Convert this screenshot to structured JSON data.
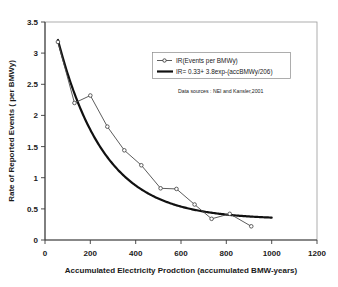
{
  "chart_data": {
    "type": "line",
    "title": "",
    "xlabel": "Accumulated Electricity Prodction (accumulated BMW-years)",
    "ylabel": "Rate of Reported Events ( per BMWy)",
    "xlim": [
      0,
      1200
    ],
    "ylim": [
      0,
      3.5
    ],
    "xticks": [
      0,
      200,
      400,
      600,
      800,
      1000,
      1200
    ],
    "xtick_labels": [
      "0",
      "200",
      "400",
      "600",
      "800",
      "1000",
      "1200"
    ],
    "yticks": [
      0,
      0.5,
      1,
      1.5,
      2,
      2.5,
      3,
      3.5
    ],
    "ytick_labels": [
      "0",
      "0.5",
      "1",
      "1.5",
      "2",
      "2.5",
      "3",
      "3.5"
    ],
    "grid": false,
    "legend_position": "upper-right-inside",
    "annotations": [
      {
        "name": "data-sources",
        "text": "Data sources : NEI and Kansler,2001",
        "x": 410,
        "y": 2.52
      }
    ],
    "series": [
      {
        "name": "IR(Events per BMWy)",
        "style": "line-with-open-circle-markers",
        "color": "#4a4a4a",
        "marker": "open-circle",
        "points": [
          {
            "x": 57,
            "y": 3.18
          },
          {
            "x": 130,
            "y": 2.2
          },
          {
            "x": 200,
            "y": 2.32
          },
          {
            "x": 275,
            "y": 1.82
          },
          {
            "x": 350,
            "y": 1.44
          },
          {
            "x": 425,
            "y": 1.2
          },
          {
            "x": 510,
            "y": 0.83
          },
          {
            "x": 580,
            "y": 0.82
          },
          {
            "x": 660,
            "y": 0.57
          },
          {
            "x": 735,
            "y": 0.34
          },
          {
            "x": 815,
            "y": 0.42
          },
          {
            "x": 910,
            "y": 0.22
          }
        ]
      },
      {
        "name": "IR= 0.33+ 3.8exp-(accBMWy/206)",
        "style": "thick-smooth-line",
        "color": "#111111",
        "marker": "none",
        "formula": "IR = 0.33 + 3.8 * exp(-x/206)",
        "formula_params": {
          "offset": 0.33,
          "amplitude": 3.8,
          "decay": 206
        },
        "x_range": [
          57,
          1000
        ]
      }
    ]
  },
  "legend": {
    "entries": [
      {
        "label": "IR(Events per BMWy)",
        "swatch": "line-marker"
      },
      {
        "label": "IR= 0.33+ 3.8exp-(accBMWy/206)",
        "swatch": "thick-line"
      }
    ]
  }
}
